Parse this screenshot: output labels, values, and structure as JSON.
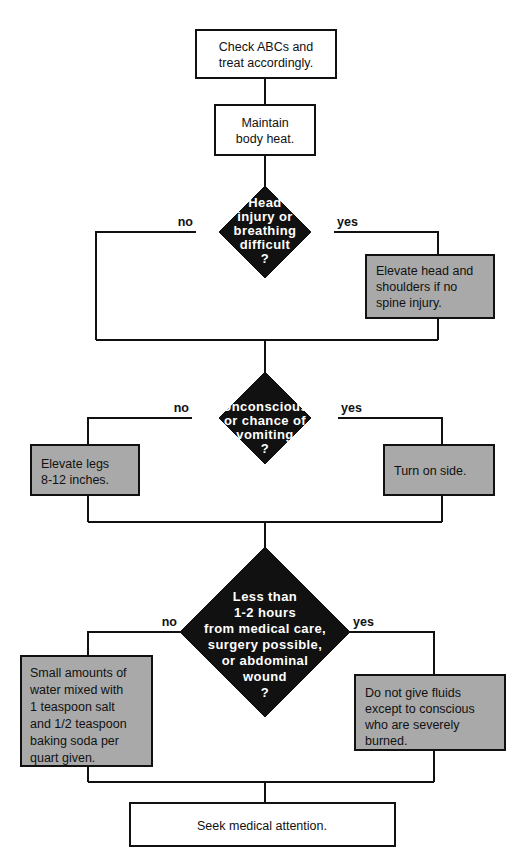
{
  "document": {
    "title": "First Aid Decision Flowchart",
    "type": "flowchart"
  },
  "colors": {
    "background": "#ffffff",
    "line": "#111111",
    "process_fill": "#ffffff",
    "action_fill": "#a9a9a9",
    "decision_fill": "#111111",
    "decision_text": "#ffffff",
    "body_text": "#111111"
  },
  "nodes": {
    "start": {
      "shape": "process",
      "lines": [
        "Check ABCs and",
        "treat accordingly."
      ]
    },
    "warmth": {
      "shape": "process",
      "lines": [
        "Maintain",
        "body heat."
      ]
    },
    "decision1": {
      "shape": "decision",
      "lines": [
        "Head",
        "injury  or",
        "breathing",
        "difficult",
        "?"
      ],
      "branch_no": "no",
      "branch_yes": "yes"
    },
    "action_head": {
      "shape": "action",
      "lines": [
        "Elevate head and",
        "shoulders if no",
        "spine injury."
      ]
    },
    "decision2": {
      "shape": "decision",
      "lines": [
        "Unconscious",
        "or chance of",
        "vomiting",
        "?"
      ],
      "branch_no": "no",
      "branch_yes": "yes"
    },
    "action_legs": {
      "shape": "action",
      "lines": [
        "Elevate legs",
        "8-12 inches."
      ]
    },
    "action_side": {
      "shape": "action",
      "lines": [
        "Turn on side."
      ]
    },
    "decision3": {
      "shape": "decision",
      "lines": [
        "Less than",
        "1-2  hours",
        "from  medical  care,",
        "surgery  possible,",
        "or abdominal",
        "wound",
        "?"
      ],
      "branch_no": "no",
      "branch_yes": "yes"
    },
    "action_fluids": {
      "shape": "action",
      "lines": [
        "Small amounts of",
        "water  mixed  with",
        "1 teaspoon salt",
        "and 1/2 teaspoon",
        "baking soda per",
        "quart given."
      ]
    },
    "action_nofluids": {
      "shape": "action",
      "lines": [
        "Do not give fluids",
        "except to conscious",
        "who are severely",
        "burned."
      ]
    },
    "end": {
      "shape": "process",
      "lines": [
        "Seek medical attention."
      ]
    }
  }
}
